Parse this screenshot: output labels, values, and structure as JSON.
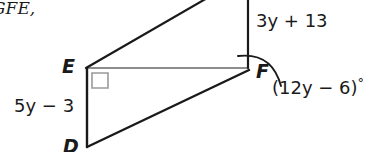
{
  "figure": {
    "type": "geometry-diagram",
    "reference_text": "GFE,",
    "vertices": [
      {
        "name": "E",
        "label": "E",
        "x": 86,
        "y": 68
      },
      {
        "name": "F",
        "label": "F",
        "x": 248,
        "y": 68
      },
      {
        "name": "D",
        "label": "D",
        "x": 87,
        "y": 146
      }
    ],
    "labels": {
      "vertex_E": "E",
      "vertex_F": "F",
      "vertex_D": "D"
    },
    "measures": {
      "segment_top_right": "3y + 13",
      "segment_left": "5y − 3",
      "angle_at_F": "(12y − 6)",
      "angle_degree_symbol": "°"
    },
    "marks": {
      "right_angle_at": "E",
      "angle_arc_at": "F"
    },
    "colors": {
      "stroke": "#1a1a1a",
      "right_angle_mark": "#9a9a9a",
      "background": "#ffffff",
      "text": "#1a1a1a"
    }
  }
}
